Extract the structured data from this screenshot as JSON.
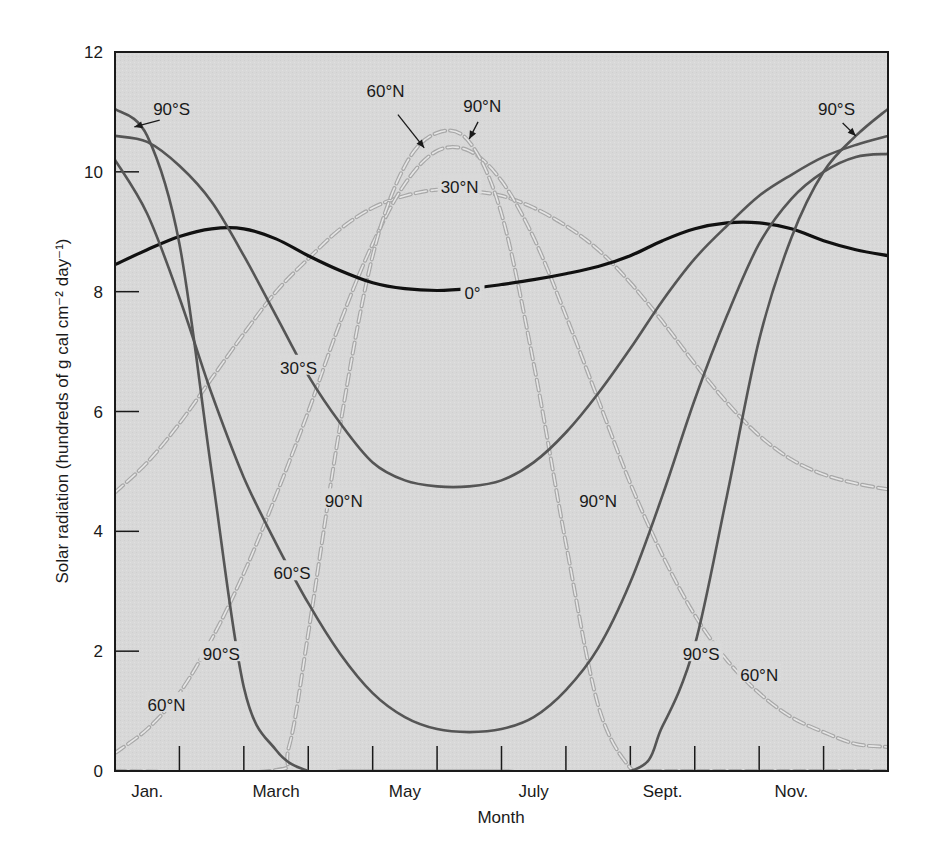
{
  "chart_data": {
    "type": "line",
    "title": "",
    "xlabel": "Month",
    "ylabel": "Solar radiation (hundreds of g cal cm⁻² day⁻¹)",
    "ylim": [
      0,
      12
    ],
    "xlim": [
      0,
      12
    ],
    "grid": false,
    "yticks": [
      0,
      2,
      4,
      6,
      8,
      10,
      12
    ],
    "x_tick_labels": [
      {
        "label": "Jan.",
        "pos": 0.5
      },
      {
        "label": "March",
        "pos": 2.5
      },
      {
        "label": "May",
        "pos": 4.5
      },
      {
        "label": "July",
        "pos": 6.5
      },
      {
        "label": "Sept.",
        "pos": 8.5
      },
      {
        "label": "Nov.",
        "pos": 10.5
      }
    ],
    "x_minor_ticks": [
      1,
      2,
      3,
      4,
      5,
      6,
      7,
      8,
      9,
      10,
      11
    ],
    "background": "#d9d9d9",
    "series": [
      {
        "name": "0°",
        "style": "solid",
        "color": "#111111",
        "width": 3.2,
        "x": [
          0,
          0.5,
          1,
          1.5,
          2,
          2.5,
          3,
          3.5,
          4,
          4.5,
          5,
          5.5,
          6,
          6.5,
          7,
          7.5,
          8,
          8.5,
          9,
          9.5,
          10,
          10.5,
          11,
          11.5,
          12
        ],
        "y": [
          8.45,
          8.7,
          8.92,
          9.05,
          9.05,
          8.88,
          8.6,
          8.35,
          8.15,
          8.05,
          8.02,
          8.05,
          8.12,
          8.2,
          8.3,
          8.42,
          8.6,
          8.85,
          9.05,
          9.15,
          9.15,
          9.05,
          8.85,
          8.7,
          8.6
        ]
      },
      {
        "name": "30°S",
        "style": "solid",
        "color": "#555555",
        "width": 2.6,
        "x": [
          0,
          0.5,
          1,
          1.5,
          2,
          2.5,
          3,
          3.5,
          4,
          4.5,
          5,
          5.5,
          6,
          6.5,
          7,
          7.5,
          8,
          8.5,
          9,
          9.5,
          10,
          10.5,
          11,
          11.5,
          12
        ],
        "y": [
          10.6,
          10.5,
          10.1,
          9.5,
          8.6,
          7.6,
          6.6,
          5.8,
          5.15,
          4.85,
          4.75,
          4.75,
          4.85,
          5.15,
          5.65,
          6.3,
          7.05,
          7.85,
          8.55,
          9.1,
          9.6,
          9.95,
          10.25,
          10.45,
          10.6
        ]
      },
      {
        "name": "60°S",
        "style": "solid",
        "color": "#555555",
        "width": 2.6,
        "x": [
          0,
          0.5,
          1,
          1.5,
          2,
          2.5,
          3,
          3.5,
          4,
          4.5,
          5,
          5.5,
          6,
          6.5,
          7,
          7.5,
          8,
          8.5,
          9,
          9.5,
          10,
          10.5,
          11,
          11.5,
          12
        ],
        "y": [
          10.2,
          9.3,
          7.9,
          6.3,
          4.9,
          3.8,
          2.8,
          1.95,
          1.3,
          0.9,
          0.7,
          0.65,
          0.7,
          0.9,
          1.35,
          2.05,
          3.15,
          4.6,
          6.2,
          7.6,
          8.8,
          9.55,
          10.0,
          10.25,
          10.3
        ]
      },
      {
        "name": "90°S",
        "style": "solid",
        "color": "#555555",
        "width": 2.6,
        "x": [
          0,
          0.5,
          1,
          1.5,
          2,
          2.5,
          3,
          3.5,
          4,
          6,
          8,
          8.5,
          9,
          9.5,
          10,
          10.5,
          11,
          11.5,
          12
        ],
        "y": [
          11.05,
          10.6,
          8.8,
          5.0,
          1.4,
          0.35,
          0.0,
          0.0,
          0.0,
          0.0,
          0.0,
          0.75,
          2.1,
          4.6,
          7.2,
          8.9,
          10.0,
          10.6,
          11.05
        ]
      },
      {
        "name": "30°N",
        "style": "dashed",
        "color": "#bfbfbf",
        "width": 2.4,
        "x": [
          0,
          0.5,
          1,
          1.5,
          2,
          2.5,
          3,
          3.5,
          4,
          4.5,
          5,
          5.5,
          6,
          6.5,
          7,
          7.5,
          8,
          8.5,
          9,
          9.5,
          10,
          10.5,
          11,
          11.5,
          12
        ],
        "y": [
          4.65,
          5.15,
          5.8,
          6.55,
          7.3,
          8.0,
          8.55,
          9.05,
          9.4,
          9.6,
          9.7,
          9.68,
          9.6,
          9.4,
          9.1,
          8.7,
          8.15,
          7.5,
          6.8,
          6.15,
          5.6,
          5.2,
          4.95,
          4.8,
          4.7
        ]
      },
      {
        "name": "60°N",
        "style": "dashed",
        "color": "#bfbfbf",
        "width": 2.4,
        "x": [
          0,
          0.5,
          1,
          1.5,
          2,
          2.5,
          3,
          3.5,
          4,
          4.5,
          5,
          5.5,
          6,
          6.5,
          7,
          7.5,
          8,
          8.5,
          9,
          9.5,
          10,
          10.5,
          11,
          11.5,
          12
        ],
        "y": [
          0.3,
          0.7,
          1.3,
          2.2,
          3.3,
          4.6,
          6.0,
          7.5,
          8.8,
          9.8,
          10.35,
          10.35,
          9.85,
          8.9,
          7.6,
          6.2,
          4.8,
          3.6,
          2.6,
          1.85,
          1.3,
          0.9,
          0.65,
          0.45,
          0.4
        ]
      },
      {
        "name": "90°N",
        "style": "dashed",
        "color": "#bfbfbf",
        "width": 2.4,
        "x": [
          0,
          2.4,
          2.7,
          3.0,
          3.5,
          4.0,
          4.5,
          5.0,
          5.5,
          6.0,
          6.5,
          7.0,
          7.5,
          8.0,
          8.3,
          8.6,
          12
        ],
        "y": [
          0,
          0,
          0.4,
          2.3,
          5.8,
          8.6,
          10.1,
          10.65,
          10.5,
          9.3,
          6.8,
          3.8,
          1.1,
          0.05,
          0,
          0,
          0
        ]
      }
    ],
    "annotations": [
      {
        "text": "90°S",
        "x": 0.88,
        "y": 11.05,
        "arrow_to": [
          0.3,
          10.75
        ]
      },
      {
        "text": "60°N",
        "x": 4.2,
        "y": 11.35,
        "arrow_to": [
          4.8,
          10.4
        ]
      },
      {
        "text": "90°N",
        "x": 5.7,
        "y": 11.1,
        "arrow_to": [
          5.5,
          10.55
        ]
      },
      {
        "text": "30°N",
        "x": 5.35,
        "y": 9.75
      },
      {
        "text": "0°",
        "x": 5.55,
        "y": 7.98
      },
      {
        "text": "30°S",
        "x": 2.85,
        "y": 6.73
      },
      {
        "text": "90°N",
        "x": 3.55,
        "y": 4.5
      },
      {
        "text": "90°N",
        "x": 7.5,
        "y": 4.5
      },
      {
        "text": "60°S",
        "x": 2.75,
        "y": 3.3
      },
      {
        "text": "90°S",
        "x": 1.65,
        "y": 1.95
      },
      {
        "text": "60°N",
        "x": 0.8,
        "y": 1.1
      },
      {
        "text": "90°S",
        "x": 9.1,
        "y": 1.95
      },
      {
        "text": "60°N",
        "x": 10.0,
        "y": 1.6
      },
      {
        "text": "90°S",
        "x": 11.2,
        "y": 11.05,
        "arrow_to": [
          11.5,
          10.6
        ]
      }
    ]
  },
  "axes": {
    "y_ticks": [
      "0",
      "2",
      "4",
      "6",
      "8",
      "10",
      "12"
    ],
    "x_labels": [
      "Jan.",
      "March",
      "May",
      "July",
      "Sept.",
      "Nov."
    ],
    "x_title": "Month",
    "y_title": "Solar radiation (hundreds of g cal cm⁻² day⁻¹)"
  }
}
